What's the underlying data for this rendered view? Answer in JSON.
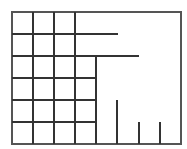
{
  "diagram": {
    "type": "partition-grid",
    "width": 187,
    "height": 149,
    "stroke_color": "#333333",
    "frame_color": "#555555",
    "frame": {
      "x": 12,
      "y": 12,
      "w": 169,
      "h": 132
    },
    "grid": {
      "columns_x": [
        12,
        33,
        54,
        75,
        96
      ],
      "rows_y": [
        12,
        34,
        56,
        78,
        100,
        122,
        144
      ]
    },
    "lines": [
      {
        "x1": 33,
        "y1": 12,
        "x2": 33,
        "y2": 144
      },
      {
        "x1": 54,
        "y1": 12,
        "x2": 54,
        "y2": 144
      },
      {
        "x1": 75,
        "y1": 12,
        "x2": 75,
        "y2": 144
      },
      {
        "x1": 96,
        "y1": 56,
        "x2": 96,
        "y2": 144
      },
      {
        "x1": 117,
        "y1": 100,
        "x2": 117,
        "y2": 144
      },
      {
        "x1": 139,
        "y1": 122,
        "x2": 139,
        "y2": 144
      },
      {
        "x1": 160,
        "y1": 122,
        "x2": 160,
        "y2": 144
      },
      {
        "x1": 12,
        "y1": 34,
        "x2": 118,
        "y2": 34
      },
      {
        "x1": 12,
        "y1": 56,
        "x2": 139,
        "y2": 56
      },
      {
        "x1": 12,
        "y1": 78,
        "x2": 96,
        "y2": 78
      },
      {
        "x1": 12,
        "y1": 100,
        "x2": 96,
        "y2": 100
      },
      {
        "x1": 12,
        "y1": 122,
        "x2": 96,
        "y2": 122
      }
    ]
  }
}
